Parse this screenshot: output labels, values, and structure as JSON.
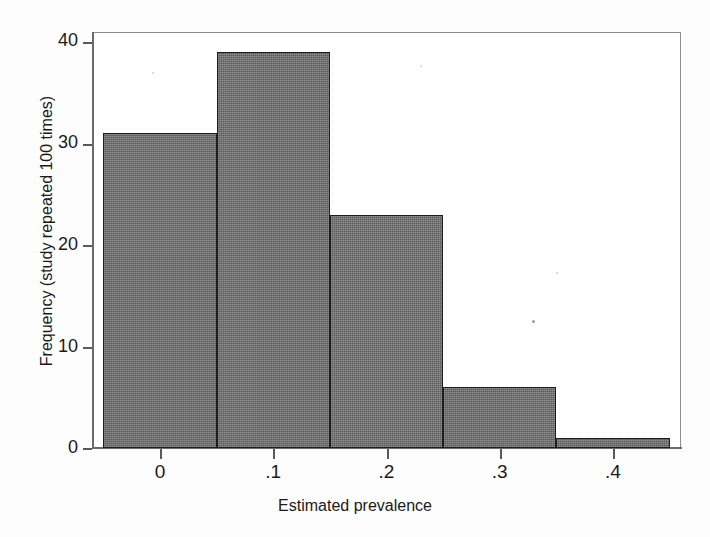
{
  "chart_data": {
    "type": "bar",
    "title": "",
    "subtitle": "",
    "xlabel": "Estimated prevalence",
    "ylabel": "Frequency (study repeated 100 times)",
    "xlim": [
      -0.06,
      0.46
    ],
    "ylim": [
      0,
      41
    ],
    "xticks": [
      0,
      0.1,
      0.2,
      0.3,
      0.4
    ],
    "xtick_labels": [
      "0",
      ".1",
      ".2",
      ".3",
      ".4"
    ],
    "yticks": [
      0,
      10,
      20,
      30,
      40
    ],
    "ytick_labels": [
      "0",
      "10",
      "20",
      "30",
      "40"
    ],
    "grid": false,
    "legend": null,
    "bin_edges": [
      -0.05,
      0.05,
      0.15,
      0.25,
      0.35,
      0.45
    ],
    "bin_width": 0.1,
    "categories": [
      "-0.05 to 0.05",
      "0.05 to 0.15",
      "0.15 to 0.25",
      "0.25 to 0.35",
      "0.35 to 0.45"
    ],
    "bin_centers": [
      0.0,
      0.1,
      0.2,
      0.3,
      0.4
    ],
    "values": [
      31,
      39,
      23,
      6,
      1
    ],
    "total": 100,
    "bar_fill_color": "#6e6e6e",
    "bar_edge_color": "#1d1d1d",
    "axis_color": "#5a5a5a",
    "background_color": "#ffffff"
  },
  "axes": {
    "y_title": "Frequency (study repeated 100 times)",
    "x_title": "Estimated prevalence",
    "y_labels": [
      "40",
      "30",
      "20",
      "10",
      "0"
    ],
    "x_labels": [
      "0",
      ".1",
      ".2",
      ".3",
      ".4"
    ]
  }
}
